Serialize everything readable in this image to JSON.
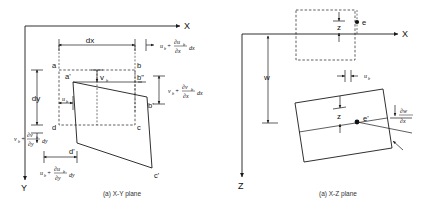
{
  "figure": {
    "type": "engineering-strain-deformation-diagram",
    "background_color": "#ffffff",
    "line_color": "#1a1a1a"
  },
  "left_panel": {
    "caption": "(a) X-Y plane",
    "axes": {
      "x_label": "X",
      "y_label": "Y"
    },
    "dimensions": {
      "dx": "dx",
      "dy": "dy"
    },
    "undeformed_vertices": {
      "a": "a",
      "b": "b",
      "c": "c",
      "d": "d"
    },
    "deformed_vertices": {
      "a_prime": "a'",
      "b_prime": "b'",
      "c_prime": "c'",
      "d_prime": "d'",
      "b_double_prime": "b\""
    },
    "displacements": {
      "u_base": "u",
      "u_sub": "b",
      "v_base": "v",
      "v_sub": "b"
    },
    "formulas": {
      "top_right": {
        "term1_base": "u",
        "term1_sub": "b",
        "plus": "+",
        "num_base": "∂u",
        "num_sub": "b",
        "den": "∂x",
        "tail": "dx"
      },
      "right_side": {
        "term1_base": "v",
        "term1_sub": "b",
        "plus": "+",
        "num_base": "∂v",
        "num_sub": "b",
        "den": "∂x",
        "tail": "dx"
      },
      "bottom": {
        "term1_base": "u",
        "term1_sub": "b",
        "plus": "+",
        "num_base": "∂u",
        "num_sub": "b",
        "den": "∂y",
        "tail": "dy"
      },
      "left_side": {
        "term1_base": "v",
        "term1_sub": "b",
        "plus": "+",
        "num_base": "∂v",
        "num_sub": "b",
        "den": "∂y",
        "tail": "dy"
      }
    }
  },
  "right_panel": {
    "caption": "(a) X-Z plane",
    "axes": {
      "x_label": "X",
      "z_label": "Z"
    },
    "dimensions": {
      "w": "w",
      "z_top": "z",
      "z_bottom": "z"
    },
    "points": {
      "e": "e",
      "e_prime": "e'"
    },
    "displacement": {
      "u_base": "u",
      "u_sub": "b"
    },
    "slope": {
      "numerator": "∂w",
      "denominator": "∂x"
    }
  }
}
